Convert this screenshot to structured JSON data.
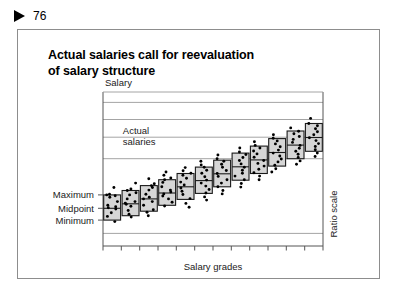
{
  "page": {
    "marker_icon": "triangle-right-icon",
    "number": "76"
  },
  "slide": {
    "title_line1": "Actual salaries call for reevaluation",
    "title_line2": "of salary structure"
  },
  "chart_data": {
    "type": "bar",
    "title": "Actual salaries call for reevaluation of salary structure",
    "subtitle": "",
    "xlabel": "Salary grades",
    "ylabel": "Salary",
    "y_right_label": "Ratio scale",
    "grid": true,
    "legend_position": "none",
    "annotations": [
      {
        "text_line1": "Actual",
        "text_line2": "salaries",
        "x": 0.09,
        "y": 0.78
      }
    ],
    "y_tick_labels": [
      "Maximum",
      "Midpoint",
      "Minimum"
    ],
    "y_tick_values": [
      0.345,
      0.255,
      0.175
    ],
    "gridlines_y": [
      0.97,
      0.855,
      0.735,
      0.59,
      0.085
    ],
    "x_tick_count": 12,
    "categories": [
      "1",
      "2",
      "3",
      "4",
      "5",
      "6",
      "7",
      "8",
      "9",
      "10",
      "11",
      "12"
    ],
    "series": [
      {
        "name": "Grade range (minimum to maximum)",
        "min": [
          0.175,
          0.205,
          0.235,
          0.275,
          0.315,
          0.355,
          0.4,
          0.445,
          0.49,
          0.54,
          0.59,
          0.64
        ],
        "mid": [
          0.255,
          0.285,
          0.318,
          0.358,
          0.4,
          0.442,
          0.488,
          0.535,
          0.582,
          0.632,
          0.682,
          0.733
        ],
        "max": [
          0.345,
          0.375,
          0.408,
          0.448,
          0.49,
          0.533,
          0.58,
          0.628,
          0.675,
          0.726,
          0.777,
          0.828
        ]
      }
    ],
    "points": {
      "name": "Actual salaries",
      "description": "Individual employee salaries plotted as dots within and around each grade range",
      "by_grade": [
        [
          0.165,
          0.2,
          0.225,
          0.25,
          0.258,
          0.265,
          0.275,
          0.3,
          0.33,
          0.34,
          0.345,
          0.35,
          0.395
        ],
        [
          0.195,
          0.215,
          0.24,
          0.268,
          0.282,
          0.29,
          0.3,
          0.318,
          0.345,
          0.36,
          0.375,
          0.385,
          0.425
        ],
        [
          0.205,
          0.228,
          0.245,
          0.275,
          0.3,
          0.318,
          0.33,
          0.35,
          0.378,
          0.395,
          0.408,
          0.42,
          0.455
        ],
        [
          0.27,
          0.295,
          0.318,
          0.338,
          0.352,
          0.365,
          0.378,
          0.4,
          0.43,
          0.448,
          0.46,
          0.478,
          0.5
        ],
        [
          0.262,
          0.288,
          0.32,
          0.348,
          0.37,
          0.392,
          0.412,
          0.432,
          0.458,
          0.478,
          0.492,
          0.508,
          0.53
        ],
        [
          0.31,
          0.332,
          0.358,
          0.382,
          0.405,
          0.425,
          0.445,
          0.468,
          0.492,
          0.512,
          0.532,
          0.548,
          0.572
        ],
        [
          0.352,
          0.375,
          0.4,
          0.425,
          0.448,
          0.47,
          0.49,
          0.51,
          0.532,
          0.552,
          0.572,
          0.59,
          0.615
        ],
        [
          0.398,
          0.422,
          0.448,
          0.472,
          0.492,
          0.512,
          0.532,
          0.555,
          0.578,
          0.598,
          0.618,
          0.635,
          0.662
        ],
        [
          0.448,
          0.472,
          0.495,
          0.518,
          0.54,
          0.558,
          0.578,
          0.6,
          0.622,
          0.642,
          0.662,
          0.68,
          0.705
        ],
        [
          0.5,
          0.522,
          0.545,
          0.568,
          0.588,
          0.608,
          0.628,
          0.648,
          0.67,
          0.69,
          0.71,
          0.728,
          0.752
        ],
        [
          0.552,
          0.575,
          0.598,
          0.62,
          0.64,
          0.66,
          0.68,
          0.7,
          0.72,
          0.74,
          0.758,
          0.775,
          0.798
        ],
        [
          0.605,
          0.628,
          0.65,
          0.672,
          0.692,
          0.712,
          0.732,
          0.752,
          0.772,
          0.792,
          0.812,
          0.828,
          0.862
        ]
      ]
    },
    "colors": {
      "box_fill": "#d6d6d6",
      "box_stroke": "#1a1a1a",
      "point": "#000000",
      "grid": "#9a9a9a",
      "axis": "#555555"
    }
  }
}
